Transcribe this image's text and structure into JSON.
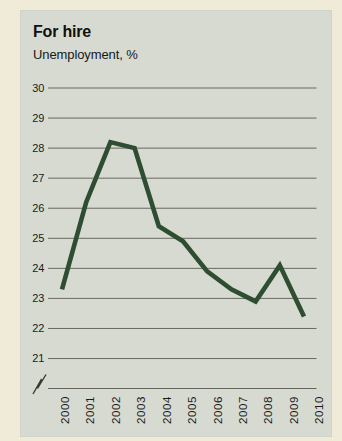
{
  "card": {
    "title": "For hire",
    "subtitle": "Unemployment, %"
  },
  "chart_data": {
    "type": "line",
    "title": "For hire",
    "subtitle": "Unemployment, %",
    "x": [
      "2000",
      "2001",
      "2002",
      "2003",
      "2004",
      "2005",
      "2006",
      "2007",
      "2008",
      "2009",
      "2010"
    ],
    "series": [
      {
        "name": "Unemployment, %",
        "values": [
          23.3,
          26.2,
          28.2,
          28.0,
          25.4,
          24.9,
          23.9,
          23.3,
          22.9,
          24.1,
          22.4
        ]
      }
    ],
    "yticks": [
      30,
      29,
      28,
      27,
      26,
      25,
      24,
      23,
      22,
      21
    ],
    "ylim": [
      21,
      30
    ],
    "xlabel": "",
    "ylabel": "Unemployment, %",
    "grid": true,
    "axis_break": true,
    "legend": "none",
    "colors": {
      "line": "#2e4d31",
      "panel_bg": "#d7dad1",
      "page_bg": "#f0ebd9",
      "grid": "#5e5e55",
      "text": "#1a1a1a"
    }
  }
}
